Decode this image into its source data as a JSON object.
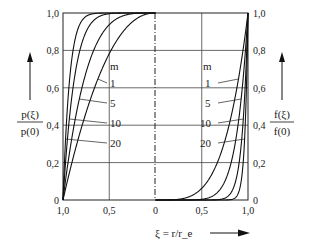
{
  "chart_data": {
    "type": "line",
    "title": "",
    "xlabel": "ξ = r/r_e",
    "ylabel_left": {
      "numerator": "p(ξ)",
      "denominator": "p(0)"
    },
    "ylabel_right": {
      "numerator": "f(ξ)",
      "denominator": "f(0)"
    },
    "x_ticks": [
      "1,0",
      "0,5",
      "0",
      "0,5",
      "1,0"
    ],
    "y_ticks": [
      "0",
      "0,2",
      "0,4",
      "0,6",
      "0,8",
      "1,0"
    ],
    "ylim": [
      0,
      1
    ],
    "xlim_left": [
      1,
      0
    ],
    "xlim_right": [
      0,
      1
    ],
    "grid": true,
    "legend_title": "m",
    "left_panel": {
      "description": "p(ξ)/p(0) vs ξ, mirrored axis from 1,0 to 0",
      "series": [
        {
          "name": "1",
          "exponent": 2.2
        },
        {
          "name": "5",
          "exponent": 4
        },
        {
          "name": "10",
          "exponent": 8
        },
        {
          "name": "20",
          "exponent": 14
        }
      ]
    },
    "right_panel": {
      "description": "f(ξ)/f(0) vs ξ from 0 to 1,0",
      "series": [
        {
          "name": "1",
          "exponent": 4
        },
        {
          "name": "5",
          "exponent": 8
        },
        {
          "name": "10",
          "exponent": 16
        },
        {
          "name": "20",
          "exponent": 30
        }
      ]
    },
    "labels": {
      "m": "m",
      "series_labels": [
        "1",
        "5",
        "10",
        "20"
      ]
    }
  }
}
